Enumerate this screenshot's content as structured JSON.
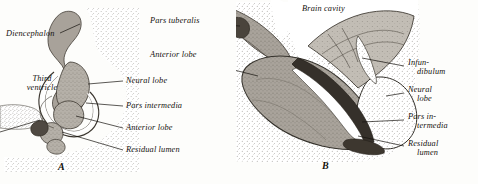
{
  "figure": {
    "type": "anatomical-illustration",
    "panels": [
      {
        "id": "A",
        "letter": "A",
        "labels": [
          {
            "name": "diencephalon",
            "text": "Diencephalon",
            "lines": [
              "Diencephalon"
            ]
          },
          {
            "name": "third-ventricle",
            "text": "Third ventricle",
            "lines": [
              "Third",
              "ventricle"
            ]
          },
          {
            "name": "neural-lobe",
            "text": "Neural lobe",
            "lines": [
              "Neural lobe"
            ]
          },
          {
            "name": "pars-intermedia",
            "text": "Pars intermedia",
            "lines": [
              "Pars intermedia"
            ]
          },
          {
            "name": "anterior-lobe",
            "text": "Anterior lobe",
            "lines": [
              "Anterior lobe"
            ]
          },
          {
            "name": "residual-lumen",
            "text": "Residual lumen",
            "lines": [
              "Residual lumen"
            ]
          }
        ]
      },
      {
        "id": "B",
        "letter": "B",
        "labels": [
          {
            "name": "pars-tuberalis",
            "text": "Pars tuberalis",
            "lines": [
              "Pars tuberalis"
            ]
          },
          {
            "name": "anterior-lobe",
            "text": "Anterior lobe",
            "lines": [
              "Anterior lobe"
            ]
          },
          {
            "name": "brain-cavity",
            "text": "Brain cavity",
            "lines": [
              "Brain cavity"
            ]
          },
          {
            "name": "infundibulum",
            "text": "Infundibulum",
            "lines": [
              "Infun-",
              "dibulum"
            ]
          },
          {
            "name": "neural-lobe",
            "text": "Neural lobe",
            "lines": [
              "Neural",
              "lobe"
            ]
          },
          {
            "name": "pars-intermedia",
            "text": "Pars intermedia",
            "lines": [
              "Pars in-",
              "termedia"
            ]
          },
          {
            "name": "residual-lumen",
            "text": "Residual lumen",
            "lines": [
              "Residual",
              "lumen"
            ]
          }
        ]
      }
    ],
    "colors": {
      "ink": "#14110d",
      "stipple": "#8c8madd",
      "gland_gray": "#9a948c",
      "dark_band": "#3a332c",
      "lumen_white": "#ffffff",
      "paper": "#fdfdfb"
    }
  }
}
